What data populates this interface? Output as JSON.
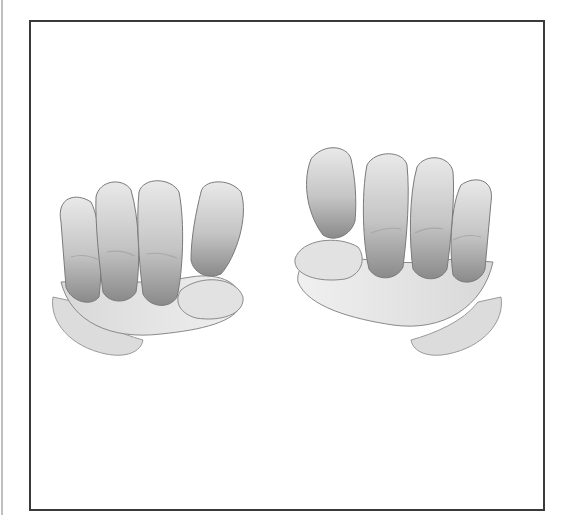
{
  "image": {
    "description": "Grayscale 3D-rendered illustration of two hands, each loosely closed into a fist with thumb tucked, facing each other inside a thin dark rectangular frame on a white background",
    "subjects": [
      {
        "name": "left-hand",
        "pose": "loose fist, thumb curled under index finger, knuckles facing viewer"
      },
      {
        "name": "right-hand",
        "pose": "loose fist, thumb curled under index finger, knuckles facing viewer (mirrored)"
      }
    ],
    "colors": {
      "background": "#ffffff",
      "frame": "#3a3a3a",
      "skin_light": "#e6e6e6",
      "skin_mid": "#bdbdbd",
      "skin_shadow": "#7a7a7a"
    }
  }
}
